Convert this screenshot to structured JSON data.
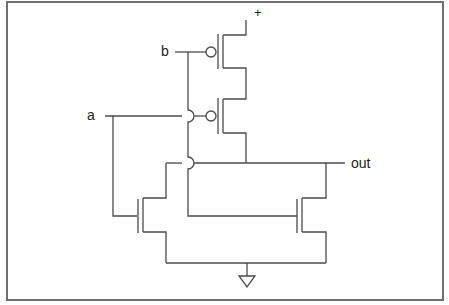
{
  "diagram": {
    "type": "CMOS NOR gate transistor schematic",
    "labels": {
      "supply": "+",
      "input_a": "a",
      "input_b": "b",
      "output": "out"
    },
    "components": [
      {
        "id": "pmos-b",
        "kind": "PMOS",
        "gate": "b",
        "between": [
          "supply",
          "mid"
        ]
      },
      {
        "id": "pmos-a",
        "kind": "PMOS",
        "gate": "a",
        "between": [
          "mid",
          "out"
        ]
      },
      {
        "id": "nmos-a",
        "kind": "NMOS",
        "gate": "a",
        "between": [
          "out",
          "ground"
        ]
      },
      {
        "id": "nmos-b",
        "kind": "NMOS",
        "gate": "b",
        "between": [
          "out",
          "ground"
        ]
      }
    ],
    "ground_symbol": "ground",
    "colors": {
      "wire": "#4a4a4a",
      "frame": "#6e6e6e",
      "text": "#222222"
    }
  }
}
